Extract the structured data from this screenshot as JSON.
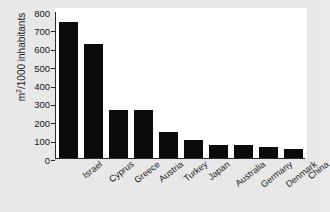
{
  "chart_data": {
    "type": "bar",
    "title": "",
    "xlabel": "",
    "ylabel": "m²/1000 inhabitants",
    "ylabel_base": "m",
    "ylabel_sup": "2",
    "ylabel_rest": "/1000 inhabitants",
    "categories": [
      "Israel",
      "Cyprus",
      "Greece",
      "Austria",
      "Turkey",
      "Japan",
      "Australia",
      "Germany",
      "Denmark",
      "China"
    ],
    "values": [
      740,
      620,
      260,
      260,
      140,
      100,
      70,
      70,
      58,
      50
    ],
    "ylim": [
      0,
      800
    ],
    "yticks": [
      0,
      100,
      200,
      300,
      400,
      500,
      600,
      700,
      800
    ],
    "ytick_labels": [
      "0",
      "100",
      "200",
      "300",
      "400",
      "500",
      "600",
      "700",
      "800"
    ],
    "grid": false,
    "legend": "none",
    "bar_color": "#0b0b0b",
    "plot_background": "#ffffff",
    "figure_background": "#e8e8e8",
    "axis_color": "#2a2a2a"
  }
}
